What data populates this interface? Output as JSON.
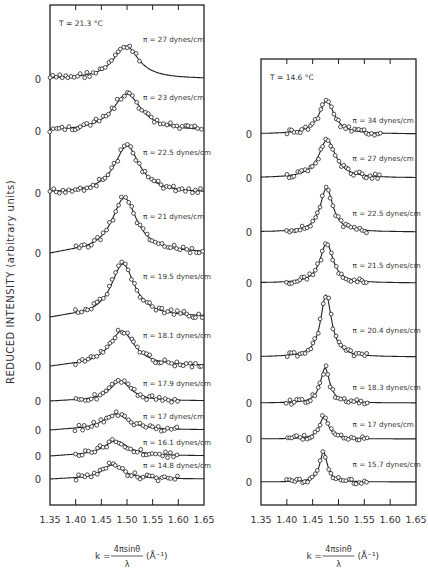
{
  "ylabel": "REDUCED INTENSITY (arbitrary units)",
  "chart_data": [
    {
      "type": "line",
      "title": "T = 21.3 °C",
      "xlabel": "k = 4π sinθ / λ (Å⁻¹)",
      "ylabel": "REDUCED INTENSITY (arbitrary units)",
      "xlim": [
        1.35,
        1.65
      ],
      "xticks": [
        "1.35",
        "1.40",
        "1.45",
        "1.50",
        "1.55",
        "1.60",
        "1.65"
      ],
      "frame": {
        "x0": 50,
        "x1": 204,
        "y0": 5,
        "y1": 505
      },
      "series": [
        {
          "name": "π = 27 dynes/cm",
          "baseline_y": 79,
          "peak_k": 1.498,
          "peak_height": 33,
          "width": 0.03,
          "label_y": 42
        },
        {
          "name": "π = 23 dynes/cm",
          "baseline_y": 131,
          "peak_k": 1.5,
          "peak_height": 37,
          "width": 0.034,
          "label_y": 100
        },
        {
          "name": "π = 22.5 dynes/cm",
          "baseline_y": 193,
          "peak_k": 1.5,
          "peak_height": 47,
          "width": 0.03,
          "label_y": 155
        },
        {
          "name": "π = 21 dynes/cm",
          "baseline_y": 253,
          "peak_k": 1.495,
          "peak_height": 55,
          "width": 0.03,
          "label_y": 219
        },
        {
          "name": "π = 19.5 dynes/cm",
          "baseline_y": 317,
          "peak_k": 1.492,
          "peak_height": 53,
          "width": 0.028,
          "label_y": 279
        },
        {
          "name": "π = 18.1 dynes/cm",
          "baseline_y": 366,
          "peak_k": 1.49,
          "peak_height": 35,
          "width": 0.03,
          "label_y": 338
        },
        {
          "name": "π = 17.9 dynes/cm",
          "baseline_y": 401,
          "peak_k": 1.487,
          "peak_height": 20,
          "width": 0.025,
          "label_y": 386
        },
        {
          "name": "π = 17 dynes/cm",
          "baseline_y": 430,
          "peak_k": 1.478,
          "peak_height": 16,
          "width": 0.03,
          "label_y": 419
        },
        {
          "name": "π = 16.1 dynes/cm",
          "baseline_y": 456,
          "peak_k": 1.478,
          "peak_height": 15,
          "width": 0.03,
          "label_y": 445
        },
        {
          "name": "π = 14.8 dynes/cm",
          "baseline_y": 479,
          "peak_k": 1.472,
          "peak_height": 14,
          "width": 0.025,
          "label_y": 468
        }
      ],
      "annotation": "T = 21.3 °C"
    },
    {
      "type": "line",
      "title": "T = 14.6 °C",
      "xlabel": "k = 4π sinθ / λ (Å⁻¹)",
      "xlim": [
        1.35,
        1.65
      ],
      "xticks": [
        "1.35",
        "1.40",
        "1.45",
        "1.50",
        "1.55",
        "1.60",
        "1.65"
      ],
      "frame": {
        "x0": 261,
        "x1": 416,
        "y0": 59,
        "y1": 505
      },
      "series": [
        {
          "name": "π = 34 dynes/cm",
          "baseline_y": 134,
          "peak_k": 1.477,
          "peak_height": 33,
          "width": 0.018,
          "label_y": 123
        },
        {
          "name": "π = 27 dynes/cm",
          "baseline_y": 178,
          "peak_k": 1.478,
          "peak_height": 38,
          "width": 0.02,
          "label_y": 161
        },
        {
          "name": "π = 22.5 dynes/cm",
          "baseline_y": 232,
          "peak_k": 1.477,
          "peak_height": 44,
          "width": 0.015,
          "label_y": 216
        },
        {
          "name": "π = 21.5 dynes/cm",
          "baseline_y": 283,
          "peak_k": 1.477,
          "peak_height": 40,
          "width": 0.015,
          "label_y": 268
        },
        {
          "name": "π = 20.4 dynes/cm",
          "baseline_y": 357,
          "peak_k": 1.476,
          "peak_height": 62,
          "width": 0.013,
          "label_y": 333
        },
        {
          "name": "π = 18.3 dynes/cm",
          "baseline_y": 403,
          "peak_k": 1.474,
          "peak_height": 35,
          "width": 0.011,
          "label_y": 390
        },
        {
          "name": "π = 17 dynes/cm",
          "baseline_y": 439,
          "peak_k": 1.472,
          "peak_height": 22,
          "width": 0.011,
          "label_y": 427
        },
        {
          "name": "π = 15.7 dynes/cm",
          "baseline_y": 482,
          "peak_k": 1.471,
          "peak_height": 30,
          "width": 0.009,
          "label_y": 467
        }
      ],
      "annotation": "T = 14.6 °C"
    }
  ],
  "zero_label": "0",
  "xlabel_text": {
    "k": "k =",
    "numer": "4πsinθ",
    "denom": "λ",
    "unit": "(Å⁻¹)"
  }
}
